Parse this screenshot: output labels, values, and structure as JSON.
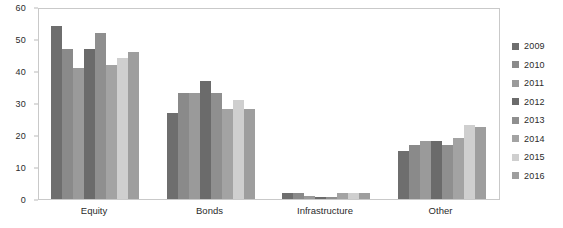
{
  "chart_data": {
    "type": "bar",
    "title": "",
    "subtitle": "",
    "xlabel": "",
    "ylabel": "",
    "ylim": [
      0,
      60
    ],
    "yticks": [
      0,
      10,
      20,
      30,
      40,
      50,
      60
    ],
    "grid": false,
    "legend_position": "right",
    "categories": [
      "Equity",
      "Bonds",
      "Infrastructure",
      "Other"
    ],
    "series": [
      {
        "name": "2009",
        "color": "#6e6e6e",
        "values": [
          54,
          27,
          2,
          15
        ]
      },
      {
        "name": "2010",
        "color": "#8a8a8a",
        "values": [
          47,
          33,
          2,
          17
        ]
      },
      {
        "name": "2011",
        "color": "#9a9a9a",
        "values": [
          41,
          33,
          1,
          18
        ]
      },
      {
        "name": "2012",
        "color": "#6b6b6b",
        "values": [
          47,
          37,
          0.5,
          18
        ]
      },
      {
        "name": "2013",
        "color": "#8f8f8f",
        "values": [
          52,
          33,
          0.5,
          17
        ]
      },
      {
        "name": "2014",
        "color": "#a3a3a3",
        "values": [
          42,
          28,
          2,
          19
        ]
      },
      {
        "name": "2015",
        "color": "#cfcfcf",
        "values": [
          44,
          31,
          2,
          23
        ]
      },
      {
        "name": "2016",
        "color": "#9e9e9e",
        "values": [
          46,
          28,
          2,
          22.5
        ]
      }
    ]
  },
  "legend": {
    "items": [
      {
        "label": "2009"
      },
      {
        "label": "2010"
      },
      {
        "label": "2011"
      },
      {
        "label": "2012"
      },
      {
        "label": "2013"
      },
      {
        "label": "2014"
      },
      {
        "label": "2015"
      },
      {
        "label": "2016"
      }
    ]
  },
  "axes": {
    "y_tick_labels": [
      "60",
      "50",
      "40",
      "30",
      "20",
      "10",
      "0"
    ],
    "x_tick_labels": [
      "Equity",
      "Bonds",
      "Infrastructure",
      "Other"
    ]
  },
  "style": {
    "plot_border_color": "#c9c9c9",
    "text_color": "#2b2b2b",
    "background": "#ffffff"
  }
}
